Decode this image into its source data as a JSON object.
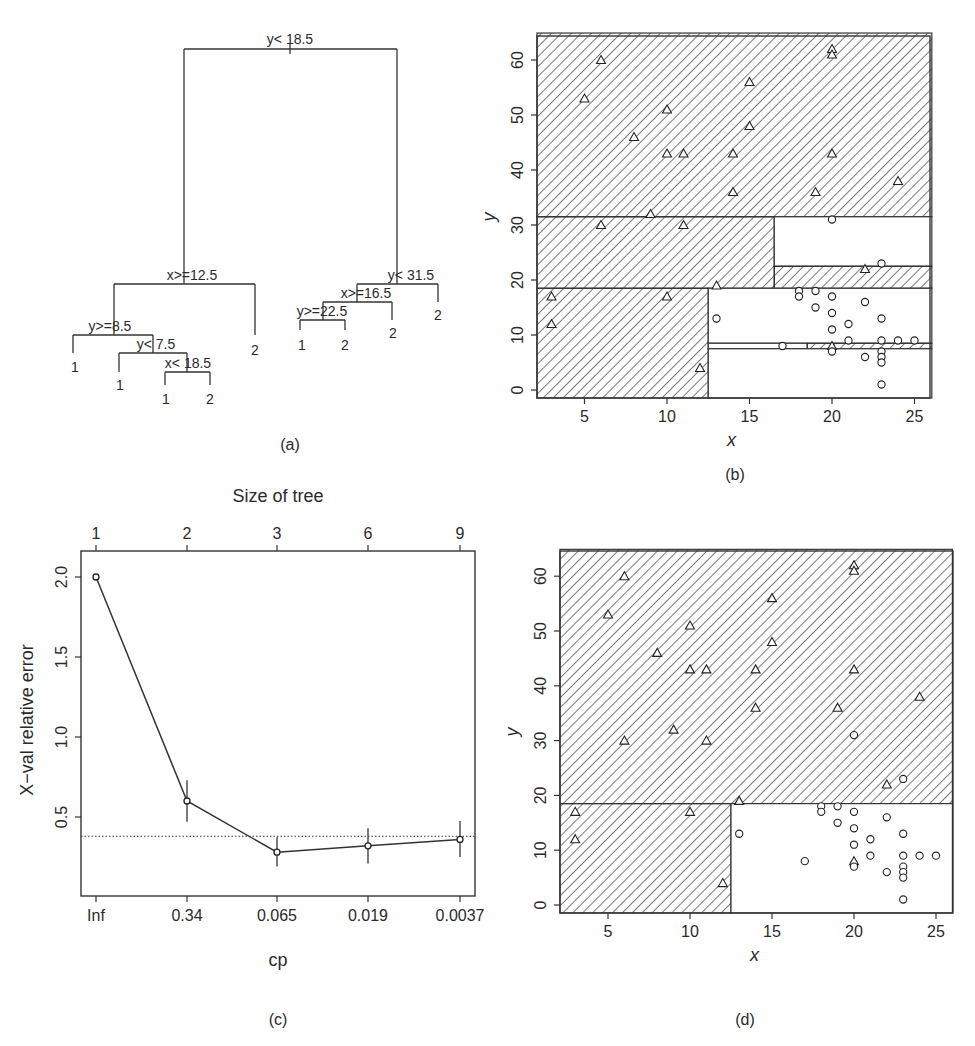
{
  "chart_data": [
    {
      "panel": "a",
      "type": "tree",
      "caption": "(a)",
      "nodes": [
        {
          "id": "root",
          "label": "y< 18.5",
          "var": "y",
          "op": "<",
          "value": 18.5
        },
        {
          "id": "L",
          "label": "x>=12.5",
          "var": "x",
          "op": ">=",
          "value": 12.5
        },
        {
          "id": "LL",
          "label": "y>=8.5",
          "var": "y",
          "op": ">=",
          "value": 8.5
        },
        {
          "id": "LLR",
          "label": "y< 7.5",
          "var": "y",
          "op": "<",
          "value": 7.5
        },
        {
          "id": "LLRR",
          "label": "x< 18.5",
          "var": "x",
          "op": "<",
          "value": 18.5
        },
        {
          "id": "R",
          "label": "y< 31.5",
          "var": "y",
          "op": "<",
          "value": 31.5
        },
        {
          "id": "RL",
          "label": "x>=16.5",
          "var": "x",
          "op": ">=",
          "value": 16.5
        },
        {
          "id": "RLL",
          "label": "y>=22.5",
          "var": "y",
          "op": ">=",
          "value": 22.5
        }
      ],
      "leaves": [
        "1",
        "1",
        "1",
        "2",
        "2",
        "1",
        "2",
        "2",
        "2"
      ]
    },
    {
      "panel": "b",
      "type": "scatter",
      "caption": "(b)",
      "xlabel": "x",
      "ylabel": "y",
      "xlim": [
        2.2,
        26
      ],
      "ylim": [
        -1.5,
        64.5
      ],
      "xticks": [
        5,
        10,
        15,
        20,
        25
      ],
      "yticks": [
        0,
        10,
        20,
        30,
        40,
        50,
        60
      ],
      "partitions": "full tree (9 leaves)"
    },
    {
      "panel": "c",
      "type": "line",
      "caption": "(c)",
      "title_top": "Size of tree",
      "xlabel": "cp",
      "ylabel": "X−val relative error",
      "categories": [
        "Inf",
        "0.34",
        "0.065",
        "0.019",
        "0.0037"
      ],
      "top_ticks": [
        "1",
        "2",
        "3",
        "6",
        "9"
      ],
      "values": [
        2.0,
        0.6,
        0.28,
        0.32,
        0.36
      ],
      "err_low": [
        2.0,
        0.47,
        0.19,
        0.21,
        0.25
      ],
      "err_high": [
        2.0,
        0.73,
        0.375,
        0.43,
        0.475
      ],
      "hline": 0.38,
      "ylim": [
        0.0,
        2.18
      ],
      "yticks": [
        0.5,
        1.0,
        1.5,
        2.0
      ]
    },
    {
      "panel": "d",
      "type": "scatter",
      "caption": "(d)",
      "xlabel": "x",
      "ylabel": "y",
      "xlim": [
        2.2,
        26
      ],
      "ylim": [
        -1.5,
        64.5
      ],
      "xticks": [
        5,
        10,
        15,
        20,
        25
      ],
      "yticks": [
        0,
        10,
        20,
        30,
        40,
        50,
        60
      ],
      "partitions": "pruned tree (3 leaves)"
    }
  ],
  "points": {
    "class2_triangles": [
      [
        6,
        60
      ],
      [
        5,
        53
      ],
      [
        10,
        51
      ],
      [
        8,
        46
      ],
      [
        15,
        56
      ],
      [
        15,
        48
      ],
      [
        10,
        43
      ],
      [
        11,
        43
      ],
      [
        14,
        43
      ],
      [
        14,
        36
      ],
      [
        20,
        62
      ],
      [
        20,
        61
      ],
      [
        20,
        43
      ],
      [
        19,
        36
      ],
      [
        24,
        38
      ],
      [
        9,
        32
      ],
      [
        6,
        30
      ],
      [
        11,
        30
      ],
      [
        22,
        22
      ],
      [
        13,
        19
      ],
      [
        3,
        17
      ],
      [
        10,
        17
      ],
      [
        3,
        12
      ],
      [
        12,
        4
      ],
      [
        20,
        8
      ]
    ],
    "class1_circles": [
      [
        20,
        31
      ],
      [
        23,
        23
      ],
      [
        18,
        18
      ],
      [
        18,
        17
      ],
      [
        19,
        18
      ],
      [
        20,
        17
      ],
      [
        22,
        16
      ],
      [
        19,
        15
      ],
      [
        20,
        14
      ],
      [
        13,
        13
      ],
      [
        23,
        13
      ],
      [
        21,
        12
      ],
      [
        20,
        11
      ],
      [
        21,
        9
      ],
      [
        23,
        9
      ],
      [
        24,
        9
      ],
      [
        25,
        9
      ],
      [
        17,
        8
      ],
      [
        20,
        7
      ],
      [
        22,
        6
      ],
      [
        23,
        7
      ],
      [
        23,
        6
      ],
      [
        23,
        5
      ],
      [
        23,
        1
      ]
    ]
  },
  "labels": {
    "a": "(a)",
    "b": "(b)",
    "c": "(c)",
    "d": "(d)",
    "x": "x",
    "y": "y",
    "cp": "cp",
    "size_of_tree": "Size of tree",
    "xval_error": "X−val relative error"
  }
}
